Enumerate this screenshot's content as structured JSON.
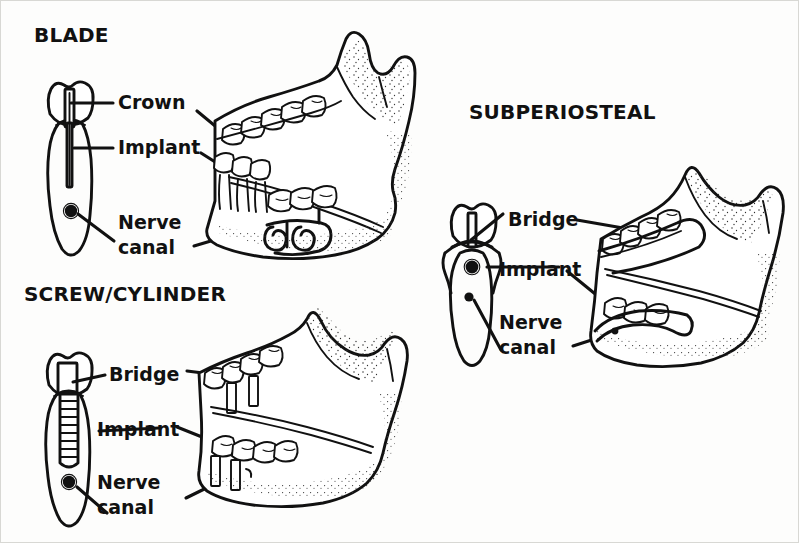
{
  "figure": {
    "background_color": "#fdfdfc",
    "ink_color": "#111111"
  },
  "panels": [
    {
      "id": "blade",
      "title": "BLADE",
      "title_pos": {
        "x": 33,
        "y": 31
      },
      "callouts": [
        {
          "key": "crown",
          "text": "Crown",
          "x": 117,
          "y": 94,
          "lines": [
            "Crown"
          ]
        },
        {
          "key": "implant",
          "text": "Implant",
          "x": 117,
          "y": 139,
          "lines": [
            "Implant"
          ]
        },
        {
          "key": "nerve",
          "text": "Nerve canal",
          "x": 117,
          "y": 211,
          "lines": [
            "Nerve",
            "canal"
          ]
        }
      ]
    },
    {
      "id": "screw-cylinder",
      "title": "SCREW/CYLINDER",
      "title_pos": {
        "x": 23,
        "y": 290
      },
      "callouts": [
        {
          "key": "bridge",
          "text": "Bridge",
          "x": 108,
          "y": 366,
          "lines": [
            "Bridge"
          ]
        },
        {
          "key": "implant",
          "text": "Implant",
          "x": 96,
          "y": 421,
          "lines": [
            "Implant"
          ]
        },
        {
          "key": "nerve",
          "text": "Nerve canal",
          "x": 96,
          "y": 471,
          "lines": [
            "Nerve",
            "canal"
          ]
        }
      ]
    },
    {
      "id": "subperiosteal",
      "title": "SUBPERIOSTEAL",
      "title_pos": {
        "x": 468,
        "y": 108
      },
      "callouts": [
        {
          "key": "bridge",
          "text": "Bridge",
          "x": 507,
          "y": 211,
          "lines": [
            "Bridge"
          ]
        },
        {
          "key": "implant",
          "text": "Implant",
          "x": 498,
          "y": 261,
          "lines": [
            "Implant"
          ]
        },
        {
          "key": "nerve",
          "text": "Nerve canal",
          "x": 498,
          "y": 311,
          "lines": [
            "Nerve",
            "canal"
          ]
        }
      ]
    }
  ],
  "anatomy_labels": {
    "crown": "Crown",
    "bridge": "Bridge",
    "implant": "Implant",
    "nerve_canal_line1": "Nerve",
    "nerve_canal_line2": "canal"
  }
}
